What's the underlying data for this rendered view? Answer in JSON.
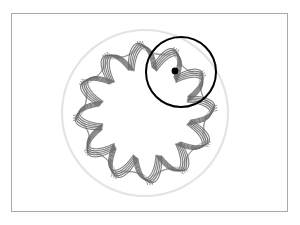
{
  "figure": {
    "background_color": "#ffffff",
    "frame": {
      "name": "image-border",
      "stroke_color": "#a8a8a8",
      "stroke_width": 1,
      "x": 11,
      "y": 13,
      "width": 277,
      "height": 199
    },
    "fixed_circle": {
      "label": "fixed outer circle",
      "stroke_color": "#e4e4e4",
      "stroke_width": 2.2,
      "cx": 145,
      "cy": 113,
      "r": 83
    },
    "rolling_circle": {
      "label": "rolling circle",
      "stroke_color": "#000000",
      "stroke_width": 2.0,
      "cx": 181,
      "cy": 72,
      "r": 35
    },
    "pen_point": {
      "label": "pen point",
      "fill_color": "#000000",
      "cx": 175,
      "cy": 71,
      "r": 3.4
    },
    "curve": {
      "label": "hypotrochoid trace",
      "stroke_color": "#6b6b6b",
      "stroke_width": 1.15,
      "center_x": 145,
      "center_y": 113,
      "lobes": 12,
      "outer_radius": 70,
      "inner_radius": 46,
      "rotation_deg": -6,
      "passes": 5,
      "pass_offset_deg": 1.6,
      "pass_radius_step": 1.1
    }
  },
  "chart_data": {
    "type": "line",
    "xlabel": "",
    "ylabel": "",
    "xlim": [
      11,
      288
    ],
    "ylim": [
      13,
      212
    ],
    "grid": false,
    "legend": "none",
    "series": [
      {
        "name": "fixed outer circle",
        "shape": "circle",
        "center": [
          145,
          113
        ],
        "radius": 83,
        "color": "#e4e4e4"
      },
      {
        "name": "hypotrochoid trace",
        "shape": "hypotrochoid",
        "center": [
          145,
          113
        ],
        "R": 83,
        "r": 35,
        "d": 23,
        "lobes": 12,
        "outer_radius": 70,
        "inner_radius": 46,
        "color": "#6b6b6b"
      },
      {
        "name": "rolling circle",
        "shape": "circle",
        "center": [
          181,
          72
        ],
        "radius": 35,
        "color": "#000000"
      },
      {
        "name": "pen point",
        "shape": "point",
        "center": [
          175,
          71
        ],
        "radius": 3.4,
        "color": "#000000"
      }
    ]
  }
}
